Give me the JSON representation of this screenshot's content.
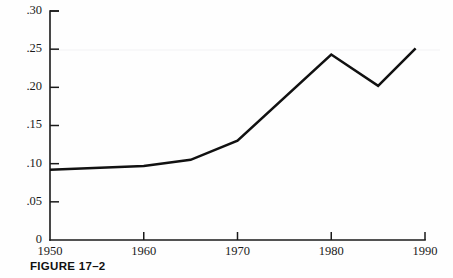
{
  "figure": {
    "caption": "FIGURE 17–2"
  },
  "chart_data": {
    "type": "line",
    "title": "",
    "xlabel": "",
    "ylabel": "",
    "xlim": [
      1950,
      1990
    ],
    "ylim": [
      0,
      0.3
    ],
    "grid": false,
    "legend": null,
    "x_ticks": [
      1950,
      1960,
      1970,
      1980,
      1990
    ],
    "x_tick_labels": [
      "1950",
      "1960",
      "1970",
      "1980",
      "1990"
    ],
    "y_ticks": [
      0,
      0.05,
      0.1,
      0.15,
      0.2,
      0.25,
      0.3
    ],
    "y_tick_labels": [
      "0",
      ".05",
      ".10",
      ".15",
      ".20",
      ".25",
      ".30"
    ],
    "series": [
      {
        "name": "series-1",
        "color": "#111111",
        "x": [
          1950,
          1960,
          1965,
          1970,
          1980,
          1985,
          1989
        ],
        "values": [
          0.092,
          0.097,
          0.105,
          0.13,
          0.243,
          0.202,
          0.251
        ]
      }
    ]
  }
}
